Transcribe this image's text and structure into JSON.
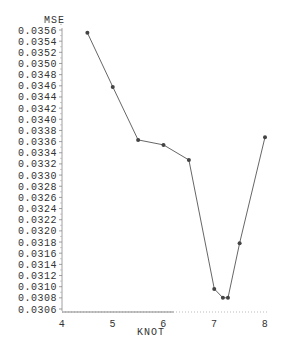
{
  "chart_data": {
    "type": "line",
    "title": "",
    "xlabel": "KNOT",
    "ylabel": "MSE",
    "xlim": [
      4,
      8
    ],
    "ylim": [
      0.0306,
      0.0356
    ],
    "x_ticks": [
      "4",
      "5",
      "6",
      "7",
      "8"
    ],
    "y_ticks": [
      "0.0356",
      "0.0354",
      "0.0352",
      "0.0350",
      "0.0348",
      "0.0346",
      "0.0344",
      "0.0342",
      "0.0340",
      "0.0338",
      "0.0336",
      "0.0334",
      "0.0332",
      "0.0330",
      "0.0328",
      "0.0326",
      "0.0324",
      "0.0322",
      "0.0320",
      "0.0318",
      "0.0316",
      "0.0314",
      "0.0312",
      "0.0310",
      "0.0308",
      "0.0306"
    ],
    "grid": false,
    "legend": null,
    "series": [
      {
        "name": "MSE",
        "marker": "dot",
        "color": "#444444",
        "x": [
          4.5,
          5.0,
          5.5,
          6.0,
          6.5,
          7.0,
          7.17,
          7.27,
          7.5,
          8.0
        ],
        "y": [
          0.03555,
          0.03458,
          0.03363,
          0.03354,
          0.03327,
          0.03096,
          0.0308,
          0.0308,
          0.03178,
          0.03368
        ]
      }
    ]
  }
}
